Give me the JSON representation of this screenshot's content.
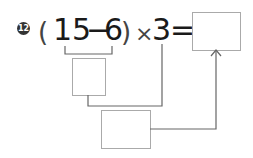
{
  "problem": {
    "number": "12",
    "open_paren": "(",
    "a": "15",
    "minus": "−",
    "b": "6",
    "close_paren": ")",
    "times": "×",
    "c": "3",
    "equals": "="
  },
  "boxes": {
    "result": "",
    "step1": "",
    "step2": ""
  }
}
